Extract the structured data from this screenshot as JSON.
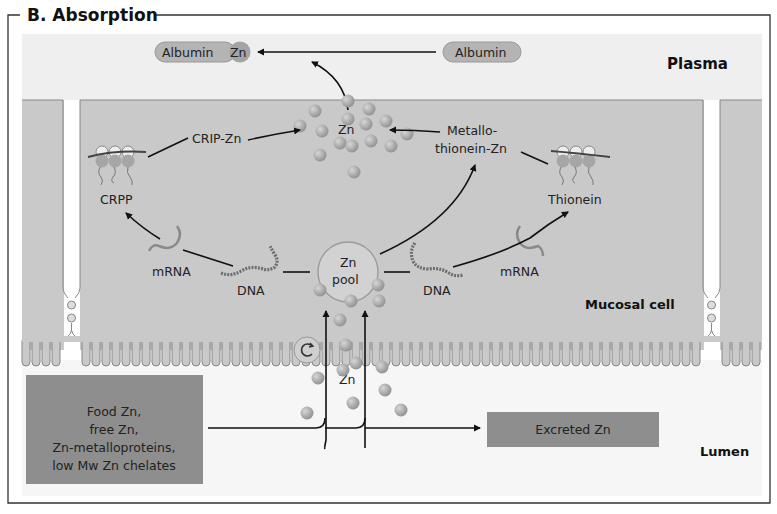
{
  "figure": {
    "title": "B. Absorption",
    "regions": {
      "plasma": "Plasma",
      "mucosal_cell": "Mucosal cell",
      "lumen": "Lumen"
    },
    "plasma_items": {
      "albumin_zn": {
        "albumin": "Albumin",
        "zn": "Zn"
      },
      "albumin": "Albumin"
    },
    "cell_items": {
      "zn_cluster": "Zn",
      "crip_zn": "CRIP-Zn",
      "metallothionein_zn_line1": "Metallo-",
      "metallothionein_zn_line2": "thionein-Zn",
      "crpp": "CRPP",
      "thionein": "Thionein",
      "mrna_left": "mRNA",
      "mrna_right": "mRNA",
      "dna_left": "DNA",
      "dna_right": "DNA",
      "zn_pool_line1": "Zn",
      "zn_pool_line2": "pool",
      "zn_transport": "Zn"
    },
    "lumen_items": {
      "food_zn_lines": [
        "Food Zn,",
        "free Zn,",
        "Zn-metalloproteins,",
        "low Mw Zn chelates"
      ],
      "excreted_zn": "Excreted Zn"
    },
    "colors": {
      "frame": "#333333",
      "plasma_bg": "#efefef",
      "cell_bg": "#c9c9c9",
      "lumen_bg": "#f6f6f6",
      "box_dark": "#8e8e8e",
      "sphere": "#a8a8a8",
      "pill": "#b4b4b4",
      "arrow": "#111111"
    }
  }
}
